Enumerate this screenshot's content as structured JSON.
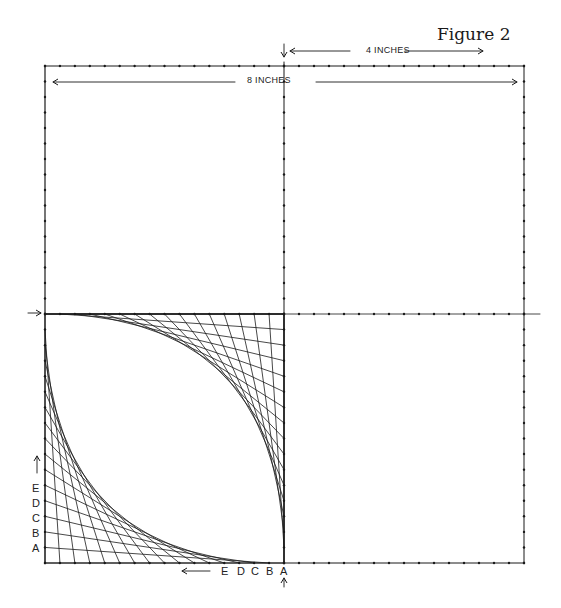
{
  "figure": {
    "title": "Figure 2",
    "top_text_fragment": "",
    "dimension_labels": {
      "half_width": "4 INCHES",
      "full_width": "8 INCHES"
    },
    "left_edge_letters": [
      "E",
      "D",
      "C",
      "B",
      "A"
    ],
    "bottom_edge_letters": [
      "E",
      "D",
      "C",
      "B",
      "A"
    ]
  },
  "geometry": {
    "square": {
      "left": 45,
      "top": 66,
      "right": 524,
      "bottom": 563
    },
    "center": {
      "x": 284,
      "y": 314
    },
    "divisions_per_half": 16,
    "line_color": "#1a1a1a",
    "dot_color": "#1a1a1a"
  }
}
